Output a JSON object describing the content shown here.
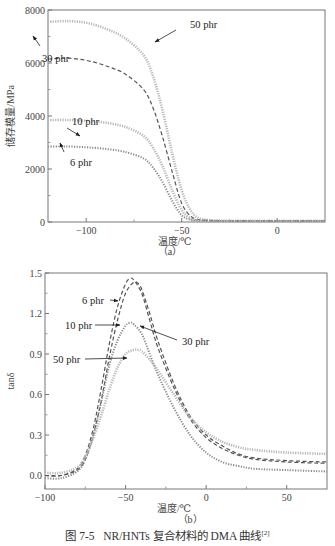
{
  "figure": {
    "caption_prefix": "图 7-5",
    "caption_text": "NR/HNTs 复合材料的 DMA 曲线",
    "caption_ref": "[2]"
  },
  "chart_data": [
    {
      "id": "a",
      "type": "line",
      "sublabel": "（a）",
      "title": "",
      "xlabel": "温度/℃",
      "ylabel": "储存模量/MPa",
      "xlim": [
        -120,
        25
      ],
      "ylim": [
        0,
        8000
      ],
      "xticks": [
        -100,
        -50,
        0
      ],
      "yticks": [
        0,
        2000,
        4000,
        6000,
        8000
      ],
      "grid": false,
      "series": [
        {
          "name": "50 phr",
          "style": "dotted-light",
          "x": [
            -120,
            -110,
            -100,
            -90,
            -80,
            -70,
            -65,
            -60,
            -55,
            -50,
            -45,
            -40,
            -30,
            -20,
            0,
            25
          ],
          "y": [
            7550,
            7580,
            7520,
            7300,
            6950,
            6300,
            5500,
            4200,
            2600,
            1200,
            400,
            120,
            50,
            40,
            40,
            40
          ]
        },
        {
          "name": "30 phr",
          "style": "dashed-dark",
          "x": [
            -120,
            -110,
            -100,
            -90,
            -80,
            -70,
            -65,
            -60,
            -55,
            -50,
            -45,
            -40,
            -30,
            -20,
            0,
            25
          ],
          "y": [
            6150,
            6180,
            6100,
            5900,
            5600,
            5000,
            4300,
            3200,
            1900,
            700,
            200,
            80,
            40,
            40,
            40,
            40
          ]
        },
        {
          "name": "10 phr",
          "style": "dotted-light",
          "x": [
            -120,
            -110,
            -100,
            -90,
            -80,
            -70,
            -65,
            -60,
            -55,
            -50,
            -45,
            -40,
            -30,
            -20,
            0,
            25
          ],
          "y": [
            3850,
            3850,
            3820,
            3750,
            3600,
            3250,
            2800,
            2100,
            1200,
            450,
            120,
            60,
            40,
            40,
            40,
            40
          ]
        },
        {
          "name": "6 phr",
          "style": "dotted-dark",
          "x": [
            -120,
            -110,
            -100,
            -90,
            -80,
            -70,
            -65,
            -60,
            -55,
            -50,
            -45,
            -40,
            -30,
            -20,
            0,
            25
          ],
          "y": [
            2850,
            2850,
            2820,
            2760,
            2650,
            2400,
            2050,
            1500,
            800,
            250,
            80,
            50,
            40,
            40,
            40,
            40
          ]
        }
      ],
      "annotations": [
        {
          "text": "50 phr",
          "target": "50 phr"
        },
        {
          "text": "30 phr",
          "target": "30 phr"
        },
        {
          "text": "10 phr",
          "target": "10 phr"
        },
        {
          "text": "6 phr",
          "target": "6 phr"
        }
      ]
    },
    {
      "id": "b",
      "type": "line",
      "sublabel": "（b）",
      "title": "",
      "xlabel": "温度/℃",
      "ylabel": "tanδ",
      "xlim": [
        -100,
        75
      ],
      "ylim": [
        -0.1,
        1.5
      ],
      "xticks": [
        -100,
        -50,
        0,
        50
      ],
      "yticks": [
        0.0,
        0.3,
        0.6,
        0.9,
        1.2,
        1.5
      ],
      "grid": false,
      "series": [
        {
          "name": "6 phr",
          "style": "dashed-dark",
          "x": [
            -100,
            -90,
            -80,
            -75,
            -70,
            -65,
            -60,
            -55,
            -50,
            -47,
            -45,
            -40,
            -35,
            -30,
            -20,
            -10,
            0,
            10,
            20,
            30,
            50,
            75
          ],
          "y": [
            0.0,
            0.0,
            0.05,
            0.15,
            0.35,
            0.65,
            0.98,
            1.25,
            1.42,
            1.46,
            1.45,
            1.35,
            1.15,
            0.95,
            0.65,
            0.42,
            0.28,
            0.2,
            0.15,
            0.12,
            0.1,
            0.09
          ]
        },
        {
          "name": "10 phr",
          "style": "dashed-dark",
          "x": [
            -100,
            -90,
            -80,
            -75,
            -70,
            -65,
            -60,
            -55,
            -50,
            -45,
            -42,
            -40,
            -35,
            -30,
            -20,
            -10,
            0,
            10,
            20,
            30,
            50,
            75
          ],
          "y": [
            0.0,
            0.0,
            0.04,
            0.12,
            0.3,
            0.56,
            0.88,
            1.15,
            1.35,
            1.43,
            1.42,
            1.38,
            1.2,
            1.0,
            0.68,
            0.44,
            0.3,
            0.22,
            0.16,
            0.13,
            0.11,
            0.1
          ]
        },
        {
          "name": "30 phr",
          "style": "dotted-dark",
          "x": [
            -100,
            -90,
            -80,
            -75,
            -70,
            -65,
            -60,
            -55,
            -50,
            -47,
            -45,
            -40,
            -35,
            -30,
            -20,
            -10,
            0,
            10,
            20,
            30,
            50,
            75
          ],
          "y": [
            -0.02,
            -0.02,
            0.03,
            0.12,
            0.3,
            0.55,
            0.82,
            1.0,
            1.11,
            1.13,
            1.12,
            1.05,
            0.9,
            0.75,
            0.5,
            0.3,
            0.17,
            0.1,
            0.07,
            0.05,
            0.04,
            0.03
          ]
        },
        {
          "name": "50 phr",
          "style": "dotted-light",
          "x": [
            -100,
            -90,
            -80,
            -75,
            -70,
            -65,
            -60,
            -55,
            -50,
            -45,
            -42,
            -40,
            -35,
            -30,
            -20,
            -10,
            0,
            10,
            20,
            30,
            50,
            75
          ],
          "y": [
            0.02,
            0.02,
            0.06,
            0.14,
            0.28,
            0.45,
            0.64,
            0.8,
            0.9,
            0.93,
            0.93,
            0.92,
            0.86,
            0.78,
            0.6,
            0.43,
            0.32,
            0.25,
            0.21,
            0.19,
            0.17,
            0.16
          ]
        }
      ],
      "annotations": [
        {
          "text": "6 phr",
          "target": "6 phr"
        },
        {
          "text": "10 phr",
          "target": "10 phr"
        },
        {
          "text": "30 phr",
          "target": "30 phr"
        },
        {
          "text": "50 phr",
          "target": "50 phr"
        }
      ]
    }
  ]
}
